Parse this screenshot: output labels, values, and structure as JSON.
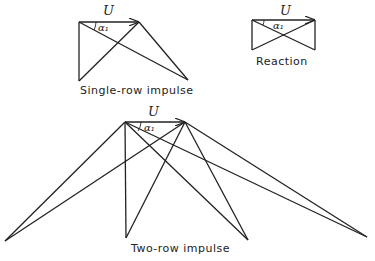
{
  "diagrams": [
    {
      "name": "single-row",
      "caption": "Single-row impulse",
      "vector_label": "U",
      "angle_label": "α₁"
    },
    {
      "name": "reaction",
      "caption": "Reaction",
      "vector_label": "U",
      "angle_label": "α₁"
    },
    {
      "name": "two-row",
      "caption": "Two-row impulse",
      "vector_label": "U",
      "angle_label": "α₁"
    }
  ],
  "colors": {
    "line": "#222222",
    "background": "#ffffff"
  }
}
